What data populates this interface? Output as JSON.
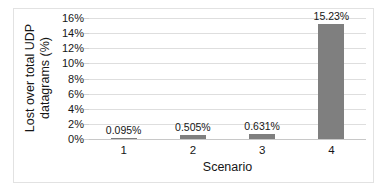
{
  "chart_data": {
    "type": "bar",
    "title": "",
    "xlabel": "Scenario",
    "ylabel": "Lost over total UDP datagrams (%)",
    "ylabel_lines": [
      "Lost over total UDP",
      "datagrams (%)"
    ],
    "categories": [
      "1",
      "2",
      "3",
      "4"
    ],
    "values": [
      0.095,
      0.505,
      0.631,
      15.23
    ],
    "data_labels": [
      "0.095%",
      "0.505%",
      "0.631%",
      "15.23%"
    ],
    "ylim": [
      0,
      16
    ],
    "ytick_values": [
      0,
      2,
      4,
      6,
      8,
      10,
      12,
      14,
      16
    ],
    "ytick_labels": [
      "0%",
      "2%",
      "4%",
      "6%",
      "8%",
      "10%",
      "12%",
      "14%",
      "16%"
    ],
    "grid": true,
    "legend": false,
    "series_color": "#7f7f7f",
    "gridline_color": "#dedede",
    "background_color": "#ffffff",
    "text_color": "#161616"
  }
}
